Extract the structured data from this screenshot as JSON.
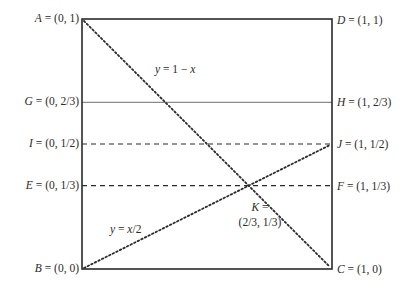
{
  "diagram": {
    "square": {
      "x0": 82,
      "y0": 19,
      "size": 250,
      "stroke": "#2a2a2a"
    },
    "points": {
      "A": {
        "letter": "A",
        "coords": "(0, 1)"
      },
      "B": {
        "letter": "B",
        "coords": "(0, 0)"
      },
      "C": {
        "letter": "C",
        "coords": "(1, 0)"
      },
      "D": {
        "letter": "D",
        "coords": "(1, 1)"
      },
      "E": {
        "letter": "E",
        "coords": "(0, 1/3)"
      },
      "F": {
        "letter": "F",
        "coords": "(1, 1/3)"
      },
      "G": {
        "letter": "G",
        "coords": "(0, 2/3)"
      },
      "H": {
        "letter": "H",
        "coords": "(1, 2/3)"
      },
      "I": {
        "letter": "I",
        "coords": "(0, 1/2)"
      },
      "J": {
        "letter": "J",
        "coords": "(1, 1/2)"
      },
      "K": {
        "letter": "K",
        "eq": "=",
        "coords": "(2/3, 1/3)"
      }
    },
    "equals": "=",
    "lines": {
      "anti_diagonal": {
        "label_y": "y",
        "label_rest": " = 1 − ",
        "label_x": "x",
        "style": "dotted"
      },
      "half_slope": {
        "label_y": "y",
        "label_rest": " = ",
        "label_x": "x",
        "label_tail": "/2",
        "style": "dotted"
      },
      "GH": {
        "style": "solid-gray"
      },
      "IJ": {
        "style": "dashed"
      },
      "EF": {
        "style": "dashed"
      }
    }
  }
}
